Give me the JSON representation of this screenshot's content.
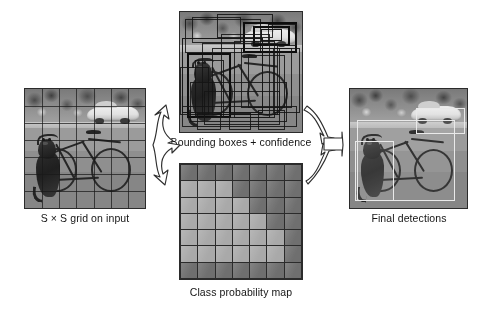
{
  "figure": {
    "panels": {
      "input": {
        "caption": "S × S grid on input",
        "grid_rows": 7,
        "grid_cols": 7,
        "scene_objects": [
          "dog",
          "bicycle",
          "car",
          "tree foliage",
          "pavement"
        ]
      },
      "boxes": {
        "caption": "Bounding boxes + confidence",
        "scene_objects": [
          "dog",
          "bicycle",
          "car",
          "tree foliage",
          "pavement"
        ]
      },
      "probmap": {
        "caption": "Class probability map",
        "grid_rows": 7,
        "grid_cols": 7
      },
      "final": {
        "caption": "Final detections",
        "scene_objects": [
          "dog",
          "bicycle",
          "car",
          "tree foliage",
          "pavement"
        ],
        "detections": [
          "dog",
          "bicycle",
          "car"
        ]
      }
    },
    "arrows": {
      "split_label": "split-arrow-right",
      "merge_label": "merge-arrow-right"
    },
    "colors": {
      "dark_cell": "#787878",
      "light_cell": "#b4b4b4",
      "mid_cell": "#9d9d9d",
      "line": "#2b2b2b",
      "arrow_fill": "#ffffff",
      "arrow_stroke": "#2f2f2f",
      "detection_box": "#e9e9e9"
    }
  },
  "chart_data": {
    "type": "heatmap",
    "title": "Class probability map",
    "xlabel": "",
    "ylabel": "",
    "grid": true,
    "legend": "none",
    "rows": 7,
    "cols": 7,
    "value_scale": {
      "low": 0.25,
      "high": 0.85
    },
    "cells": [
      [
        0.25,
        0.25,
        0.25,
        0.25,
        0.25,
        0.25,
        0.25
      ],
      [
        0.8,
        0.8,
        0.8,
        0.25,
        0.25,
        0.25,
        0.25
      ],
      [
        0.8,
        0.8,
        0.8,
        0.8,
        0.25,
        0.25,
        0.25
      ],
      [
        0.8,
        0.8,
        0.8,
        0.8,
        0.8,
        0.25,
        0.25
      ],
      [
        0.8,
        0.8,
        0.8,
        0.8,
        0.8,
        0.8,
        0.25
      ],
      [
        0.8,
        0.8,
        0.8,
        0.8,
        0.8,
        0.8,
        0.25
      ],
      [
        0.25,
        0.25,
        0.25,
        0.25,
        0.25,
        0.25,
        0.25
      ]
    ]
  },
  "bboxes": [
    {
      "x": 4,
      "y": 6,
      "w": 62,
      "h": 28,
      "weight": "thin"
    },
    {
      "x": 10,
      "y": 4,
      "w": 40,
      "h": 22,
      "weight": "thin"
    },
    {
      "x": 30,
      "y": 2,
      "w": 46,
      "h": 20,
      "weight": "thin"
    },
    {
      "x": 52,
      "y": 8,
      "w": 44,
      "h": 26,
      "weight": "thick"
    },
    {
      "x": 60,
      "y": 12,
      "w": 30,
      "h": 16,
      "weight": "thick"
    },
    {
      "x": 66,
      "y": 14,
      "w": 18,
      "h": 10,
      "weight": "med"
    },
    {
      "x": 72,
      "y": 10,
      "w": 24,
      "h": 18,
      "weight": "thin"
    },
    {
      "x": 2,
      "y": 22,
      "w": 66,
      "h": 62,
      "weight": "med"
    },
    {
      "x": 6,
      "y": 34,
      "w": 36,
      "h": 54,
      "weight": "thick"
    },
    {
      "x": 12,
      "y": 40,
      "w": 24,
      "h": 48,
      "weight": "thin"
    },
    {
      "x": 18,
      "y": 26,
      "w": 62,
      "h": 60,
      "weight": "thin"
    },
    {
      "x": 26,
      "y": 30,
      "w": 56,
      "h": 56,
      "weight": "thin"
    },
    {
      "x": 34,
      "y": 18,
      "w": 40,
      "h": 70,
      "weight": "thin"
    },
    {
      "x": 44,
      "y": 24,
      "w": 34,
      "h": 64,
      "weight": "thin"
    },
    {
      "x": 50,
      "y": 30,
      "w": 42,
      "h": 50,
      "weight": "thin"
    },
    {
      "x": 56,
      "y": 36,
      "w": 30,
      "h": 44,
      "weight": "thin"
    },
    {
      "x": 8,
      "y": 58,
      "w": 80,
      "h": 34,
      "weight": "thin"
    },
    {
      "x": 20,
      "y": 66,
      "w": 62,
      "h": 28,
      "weight": "thin"
    },
    {
      "x": 2,
      "y": 78,
      "w": 94,
      "h": 18,
      "weight": "thin"
    },
    {
      "x": 14,
      "y": 84,
      "w": 20,
      "h": 14,
      "weight": "thin"
    },
    {
      "x": 40,
      "y": 84,
      "w": 18,
      "h": 14,
      "weight": "thin"
    },
    {
      "x": 64,
      "y": 82,
      "w": 22,
      "h": 16,
      "weight": "thin"
    },
    {
      "x": 0,
      "y": 46,
      "w": 24,
      "h": 40,
      "weight": "thin"
    },
    {
      "x": 76,
      "y": 30,
      "w": 22,
      "h": 54,
      "weight": "thin"
    }
  ],
  "detections_geom": [
    {
      "name": "car-detection",
      "x": 56,
      "y": 16,
      "w": 42,
      "h": 22
    },
    {
      "name": "dog-detection",
      "x": 4,
      "y": 44,
      "w": 34,
      "h": 50
    },
    {
      "name": "bicycle-detection",
      "x": 6,
      "y": 26,
      "w": 84,
      "h": 68
    }
  ]
}
